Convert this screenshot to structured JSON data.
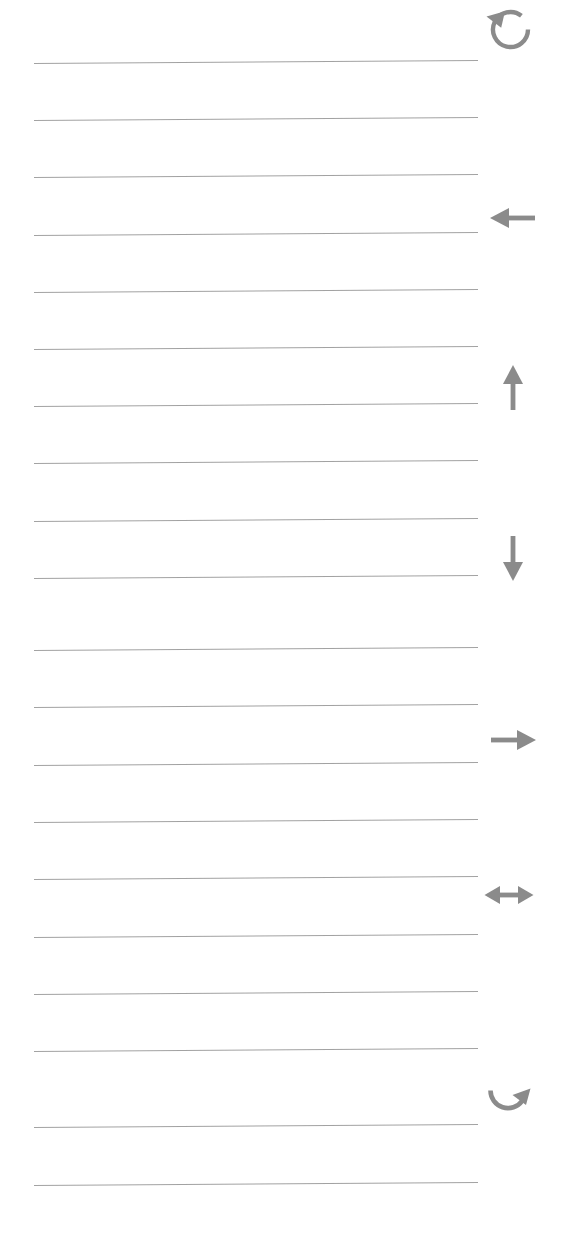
{
  "page": {
    "kind": "ruled-notepad-page",
    "width": 572,
    "height": 1236,
    "background_color": "#ffffff",
    "rule_color": "#9a9a9a",
    "icon_color": "#8b8b8b",
    "rule_count": 20,
    "text_content": "",
    "notes_written": "none"
  },
  "rules": [
    {
      "name": "rule-line-1",
      "x": 34,
      "y": 63,
      "width": 444,
      "tilt_deg": -0.38
    },
    {
      "name": "rule-line-2",
      "x": 34,
      "y": 120,
      "width": 444,
      "tilt_deg": -0.38
    },
    {
      "name": "rule-line-3",
      "x": 34,
      "y": 177,
      "width": 444,
      "tilt_deg": -0.38
    },
    {
      "name": "rule-line-4",
      "x": 34,
      "y": 235,
      "width": 444,
      "tilt_deg": -0.38
    },
    {
      "name": "rule-line-5",
      "x": 34,
      "y": 292,
      "width": 444,
      "tilt_deg": -0.38
    },
    {
      "name": "rule-line-6",
      "x": 34,
      "y": 349,
      "width": 444,
      "tilt_deg": -0.38
    },
    {
      "name": "rule-line-7",
      "x": 34,
      "y": 406,
      "width": 444,
      "tilt_deg": -0.38
    },
    {
      "name": "rule-line-8",
      "x": 34,
      "y": 463,
      "width": 444,
      "tilt_deg": -0.38
    },
    {
      "name": "rule-line-9",
      "x": 34,
      "y": 521,
      "width": 444,
      "tilt_deg": -0.38
    },
    {
      "name": "rule-line-10",
      "x": 34,
      "y": 578,
      "width": 444,
      "tilt_deg": -0.38
    },
    {
      "name": "rule-line-11",
      "x": 34,
      "y": 650,
      "width": 444,
      "tilt_deg": -0.38
    },
    {
      "name": "rule-line-12",
      "x": 34,
      "y": 707,
      "width": 444,
      "tilt_deg": -0.38
    },
    {
      "name": "rule-line-13",
      "x": 34,
      "y": 765,
      "width": 444,
      "tilt_deg": -0.38
    },
    {
      "name": "rule-line-14",
      "x": 34,
      "y": 822,
      "width": 444,
      "tilt_deg": -0.38
    },
    {
      "name": "rule-line-15",
      "x": 34,
      "y": 879,
      "width": 444,
      "tilt_deg": -0.38
    },
    {
      "name": "rule-line-16",
      "x": 34,
      "y": 937,
      "width": 444,
      "tilt_deg": -0.38
    },
    {
      "name": "rule-line-17",
      "x": 34,
      "y": 994,
      "width": 444,
      "tilt_deg": -0.38
    },
    {
      "name": "rule-line-18",
      "x": 34,
      "y": 1051,
      "width": 444,
      "tilt_deg": -0.38
    },
    {
      "name": "rule-line-19",
      "x": 34,
      "y": 1127,
      "width": 444,
      "tilt_deg": -0.38
    },
    {
      "name": "rule-line-20",
      "x": 34,
      "y": 1185,
      "width": 444,
      "tilt_deg": -0.38
    }
  ],
  "icons": [
    {
      "name": "undo-icon",
      "label": "Undo",
      "glyph": "counter-clockwise-rotate-arrow",
      "x": 483,
      "y": 2,
      "size": 52,
      "color": "#8b8b8b"
    },
    {
      "name": "arrow-left-icon",
      "label": "Arrow Left",
      "glyph": "arrow-left",
      "x": 487,
      "y": 192,
      "size": 52,
      "color": "#8b8b8b"
    },
    {
      "name": "arrow-up-icon",
      "label": "Arrow Up",
      "glyph": "arrow-up",
      "x": 487,
      "y": 362,
      "size": 52,
      "color": "#8b8b8b"
    },
    {
      "name": "arrow-down-icon",
      "label": "Arrow Down",
      "glyph": "arrow-down",
      "x": 487,
      "y": 532,
      "size": 52,
      "color": "#8b8b8b"
    },
    {
      "name": "arrow-right-icon",
      "label": "Arrow Right",
      "glyph": "arrow-right",
      "x": 487,
      "y": 714,
      "size": 52,
      "color": "#8b8b8b"
    },
    {
      "name": "arrow-left-right-icon",
      "label": "Arrow Left Right",
      "glyph": "arrow-left-right",
      "x": 483,
      "y": 869,
      "size": 52,
      "color": "#8b8b8b"
    },
    {
      "name": "redo-icon",
      "label": "Redo",
      "glyph": "clockwise-rotate-arrow",
      "x": 483,
      "y": 1073,
      "size": 52,
      "color": "#8b8b8b"
    }
  ]
}
